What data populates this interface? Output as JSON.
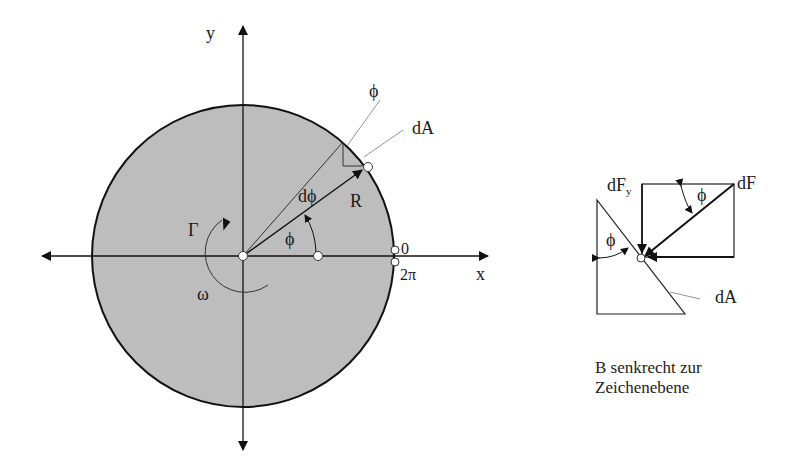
{
  "diagram": {
    "type": "physics-diagram",
    "main_figure": {
      "axes": {
        "x_label": "x",
        "y_label": "y"
      },
      "disk": {
        "fill": "#bdbdbd",
        "stroke": "#111111"
      },
      "labels": {
        "phi_top": "ϕ",
        "dA_top": "dA",
        "dphi": "dϕ",
        "R": "R",
        "phi_angle": "ϕ",
        "gamma": "Γ",
        "omega": "ω",
        "zero": "0",
        "two_pi": "2π"
      }
    },
    "side_figure": {
      "labels": {
        "dFy_main": "dF",
        "dFy_sub": "y",
        "dF": "dF",
        "phi_upper": "ϕ",
        "phi_left": "ϕ",
        "dA": "dA"
      },
      "note_line1": "B senkrecht zur",
      "note_line2": "Zeichenebene"
    }
  }
}
